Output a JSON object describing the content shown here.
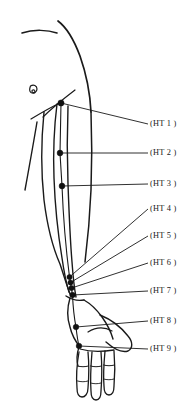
{
  "figure": {
    "background_color": "#ffffff",
    "ink_color": "#1a1a1a"
  },
  "labels": [
    {
      "id": "ht1",
      "text": "(HT 1 )",
      "x": 150,
      "y": 120,
      "point_x": 61,
      "point_y": 103,
      "leader_start_x": 148,
      "leader_start_y": 124
    },
    {
      "id": "ht2",
      "text": "(HT 2 )",
      "x": 150,
      "y": 149,
      "point_x": 60,
      "point_y": 153,
      "leader_start_x": 148,
      "leader_start_y": 153
    },
    {
      "id": "ht3",
      "text": "(HT 3 )",
      "x": 150,
      "y": 180,
      "point_x": 62,
      "point_y": 186,
      "leader_start_x": 148,
      "leader_start_y": 184
    },
    {
      "id": "ht4",
      "text": "(HT 4 )",
      "x": 150,
      "y": 205,
      "point_x": 69,
      "point_y": 277,
      "leader_start_x": 148,
      "leader_start_y": 209
    },
    {
      "id": "ht5",
      "text": "(HT 5 )",
      "x": 150,
      "y": 232,
      "point_x": 70,
      "point_y": 282,
      "leader_start_x": 148,
      "leader_start_y": 236
    },
    {
      "id": "ht6",
      "text": "(HT 6 )",
      "x": 150,
      "y": 259,
      "point_x": 71,
      "point_y": 288,
      "leader_start_x": 148,
      "leader_start_y": 263
    },
    {
      "id": "ht7",
      "text": "(HT 7 )",
      "x": 150,
      "y": 287,
      "point_x": 72,
      "point_y": 295,
      "leader_start_x": 148,
      "leader_start_y": 291
    },
    {
      "id": "ht8",
      "text": "(HT 8 )",
      "x": 150,
      "y": 317,
      "point_x": 76,
      "point_y": 327,
      "leader_start_x": 148,
      "leader_start_y": 321
    },
    {
      "id": "ht9",
      "text": "(HT 9 )",
      "x": 150,
      "y": 345,
      "point_x": 79,
      "point_y": 346,
      "leader_start_x": 148,
      "leader_start_y": 349
    }
  ],
  "points": [
    {
      "id": "ht1",
      "name": "Jiquan",
      "cx": 61,
      "cy": 103,
      "r": 3.1
    },
    {
      "id": "ht2",
      "name": "Qingling",
      "cx": 60,
      "cy": 153,
      "r": 2.9
    },
    {
      "id": "ht3",
      "name": "Shaohai",
      "cx": 62,
      "cy": 186,
      "r": 2.9
    },
    {
      "id": "ht4",
      "name": "Lingdao",
      "cx": 69.5,
      "cy": 277,
      "r": 2.6
    },
    {
      "id": "ht5",
      "name": "Tongli",
      "cx": 70.5,
      "cy": 282.5,
      "r": 2.6
    },
    {
      "id": "ht6",
      "name": "Yinxi",
      "cx": 71.5,
      "cy": 288,
      "r": 2.6
    },
    {
      "id": "ht7",
      "name": "Shenmen",
      "cx": 72.5,
      "cy": 295,
      "r": 2.8
    },
    {
      "id": "ht8",
      "name": "Shaofu",
      "cx": 76,
      "cy": 327,
      "r": 2.8
    },
    {
      "id": "ht9",
      "name": "Shaochong",
      "cx": 79,
      "cy": 346,
      "r": 2.8
    }
  ],
  "anatomy": {
    "clavicle": "M 22,33 C 34,29 48,30 57,33",
    "nipple_outer": "M 33,89 a 3.6,4.1 0 1,0 0.1,0",
    "nipple_inner": "M 34.5,91.5 a 1.5,1.6 0 1,0 0.1,0",
    "neck_shoulder": "M 58,21 C 66,27 74,40 80,56 C 86,73 90,92 91,112",
    "torso_side": "M 91,112 C 92,138 92,164 91,190 C 90,214 88,238 85,262",
    "armpit_crease": "M 40,115 C 48,109 56,104 71,93",
    "chest_fold": "M 32,118 C 42,112 52,107 60,103",
    "arm_front": "M 59,103 C 56,126 54,150 55,176 C 56,204 58,232 62,258 C 64,272 66,282 69,292",
    "arm_back": "M 68,104 C 67,130 67,156 68,182 C 69,210 70,238 72,262 C 73,276 74,286 76,296",
    "arm_outer": "M 35,124 C 31,148 28,168 24,190",
    "upper_arm_outer": "M 45,110 C 41,140 40,170 42,198 C 44,222 48,244 56,264 C 62,278 66,286 70,293",
    "forearm_outer": "M 58,196 C 54,218 54,238 58,258 C 62,274 66,284 70,293",
    "elbow_bulge": "M 64,262 C 66,272 67,282 69,293",
    "wrist_crease": "M 66,296 C 71,299 77,300 83,299",
    "hand_back": "M 70,297 C 68,306 68,316 70,325 C 72,334 76,341 80,346",
    "hand_thumb_side": "M 84,299 C 90,303 96,309 101,316 C 106,323 110,331 112,338",
    "thumb_outline": "M 101,316 C 110,320 120,327 127,335 C 132,341 133,347 129,350 C 124,353 116,350 108,344",
    "palm_edge": "M 80,346 C 86,350 94,352 102,352 C 110,352 117,350 122,347",
    "hand_lower": "M 79,347 C 77,354 77,360 79,366",
    "finger1_out": "M 79,352 C 77,362 76,375 77,388 C 77,394 79,397 82,397 C 85,397 87,394 87,388 C 88,375 88,362 87,352",
    "finger2_out": "M 91,352 C 90,364 89,378 90,391 C 90,397 92,400 95,400 C 98,400 100,397 100,391 C 101,378 101,364 100,352",
    "finger3_out": "M 104,351 C 103,362 102,374 103,386 C 103,392 105,395 108,395 C 111,395 113,392 113,386 C 114,374 114,362 113,351",
    "finger1_crease": "M 78,366 C 81,367 85,367 88,366",
    "finger2_crease": "M 90,366 C 93,367 97,367 100,366",
    "finger3_crease": "M 103,365 C 106,366 110,366 113,365",
    "knuckle_line": "M 80,349 C 90,351 102,351 113,350",
    "palm_arc": "M 89,333 C 97,329 106,329 113,333",
    "meridian_upper": "M 61,103 L 60,153 L 62,186",
    "meridian_fore": "M 62,186 C 63,212 65,240 69,277",
    "meridian_wrist": "M 69,277 L 72.5,295",
    "meridian_hand": "M 72.5,295 C 73,306 74,316 76,327 C 77,336 78,342 79,346"
  }
}
